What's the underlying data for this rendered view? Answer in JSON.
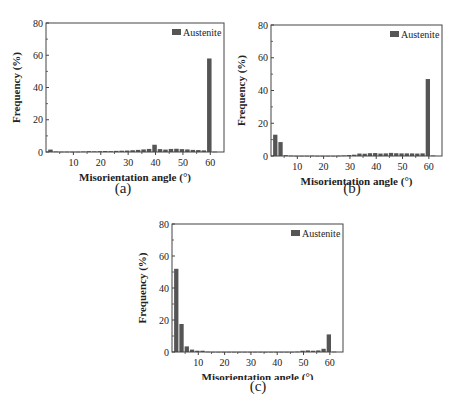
{
  "figure": {
    "panels": [
      {
        "id": "a",
        "caption": "(a)"
      },
      {
        "id": "b",
        "caption": "(b)"
      },
      {
        "id": "c",
        "caption": "(c)"
      }
    ]
  },
  "chart_data": [
    {
      "type": "bar",
      "panel": "(a)",
      "title": "",
      "xlabel": "Misorientation angle (°)",
      "ylabel": "Frequency (%)",
      "xlim": [
        0,
        65
      ],
      "ylim": [
        0,
        80
      ],
      "xticks": [
        10,
        20,
        30,
        40,
        50,
        60
      ],
      "yticks": [
        0,
        20,
        40,
        60,
        80
      ],
      "legend": [
        "Austenite"
      ],
      "legend_position": "upper right",
      "grid": false,
      "bar_color": "#555555",
      "x": [
        2,
        4,
        6,
        8,
        10,
        12,
        14,
        16,
        18,
        20,
        22,
        24,
        26,
        28,
        30,
        32,
        34,
        36,
        38,
        40,
        42,
        44,
        46,
        48,
        50,
        52,
        54,
        56,
        58,
        60,
        62
      ],
      "series": [
        {
          "name": "Austenite",
          "values": [
            1.5,
            0.3,
            0.2,
            0.2,
            0.2,
            0.2,
            0.3,
            0.5,
            0.4,
            0.5,
            0.6,
            0.5,
            0.7,
            0.8,
            0.9,
            1.1,
            1.3,
            1.6,
            1.9,
            4.5,
            1.8,
            1.5,
            1.9,
            2.0,
            1.8,
            1.6,
            1.3,
            1.2,
            1.0,
            58,
            0.2
          ]
        }
      ]
    },
    {
      "type": "bar",
      "panel": "(b)",
      "title": "",
      "xlabel": "Misorientation angle (°)",
      "ylabel": "Frequency (%)",
      "xlim": [
        0,
        65
      ],
      "ylim": [
        0,
        80
      ],
      "xticks": [
        10,
        20,
        30,
        40,
        50,
        60
      ],
      "yticks": [
        0,
        20,
        40,
        60,
        80
      ],
      "legend": [
        "Austenite"
      ],
      "legend_position": "upper right",
      "grid": false,
      "bar_color": "#555555",
      "x": [
        2,
        4,
        6,
        8,
        10,
        12,
        14,
        16,
        18,
        20,
        22,
        24,
        26,
        28,
        30,
        32,
        34,
        36,
        38,
        40,
        42,
        44,
        46,
        48,
        50,
        52,
        54,
        56,
        58,
        60,
        62
      ],
      "series": [
        {
          "name": "Austenite",
          "values": [
            13,
            8.5,
            0.5,
            0.2,
            0.1,
            0.1,
            0.1,
            0.2,
            0.1,
            0.1,
            0.1,
            0.1,
            0.2,
            0.3,
            0.6,
            0.8,
            1.5,
            1.4,
            1.7,
            1.8,
            1.5,
            1.6,
            1.9,
            1.7,
            1.6,
            1.6,
            1.6,
            1.5,
            1.6,
            47,
            0.3
          ]
        }
      ]
    },
    {
      "type": "bar",
      "panel": "(c)",
      "title": "",
      "xlabel": "Misorientation angle (°)",
      "ylabel": "Frequency (%)",
      "xlim": [
        0,
        65
      ],
      "ylim": [
        0,
        80
      ],
      "xticks": [
        10,
        20,
        30,
        40,
        50,
        60
      ],
      "yticks": [
        0,
        20,
        40,
        60,
        80
      ],
      "legend": [
        "Austenite"
      ],
      "legend_position": "upper right",
      "grid": false,
      "bar_color": "#555555",
      "x": [
        2,
        4,
        6,
        8,
        10,
        12,
        14,
        16,
        18,
        20,
        22,
        24,
        26,
        28,
        30,
        32,
        34,
        36,
        38,
        40,
        42,
        44,
        46,
        48,
        50,
        52,
        54,
        56,
        58,
        60,
        62
      ],
      "series": [
        {
          "name": "Austenite",
          "values": [
            52,
            17.5,
            3.5,
            1.5,
            0.8,
            0.8,
            0.2,
            0.1,
            0.1,
            0.1,
            0.1,
            0.1,
            0.1,
            0.1,
            0.1,
            0.1,
            0.1,
            0.1,
            0.1,
            0.1,
            0.1,
            0.1,
            0.1,
            0.2,
            0.8,
            1.0,
            0.8,
            1.0,
            2.0,
            11,
            0.2
          ]
        }
      ]
    }
  ]
}
